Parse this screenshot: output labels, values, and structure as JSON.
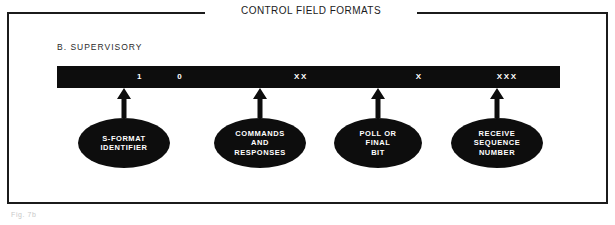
{
  "figure": {
    "title": "CONTROL FIELD FORMATS",
    "section_label": "B. SUPERVISORY",
    "bottom_caption": "Fig. 7b"
  },
  "colors": {
    "bar_fill": "#0d0d0d",
    "bar_text": "#ffffff",
    "frame_border": "#1b1b1b",
    "page_background": "#ffffff",
    "ellipse_fill": "#0d0d0d"
  },
  "field_bar": {
    "bits": [
      {
        "label": "1",
        "center_pct": 16.5
      },
      {
        "label": "0",
        "center_pct": 24.5
      },
      {
        "label": "XX",
        "center_pct": 48.5
      },
      {
        "label": "X",
        "center_pct": 72.0
      },
      {
        "label": "XXX",
        "center_pct": 89.5
      }
    ]
  },
  "callouts": [
    {
      "name": "s-format-identifier",
      "text": "S-FORMAT\nIDENTIFIER",
      "center_x": 124,
      "ellipse_width": 92,
      "ellipse_height": 50,
      "arrow_icon": "arrow-up-icon"
    },
    {
      "name": "commands-and-responses",
      "text": "COMMANDS\nAND\nRESPONSES",
      "center_x": 260,
      "ellipse_width": 92,
      "ellipse_height": 50,
      "arrow_icon": "arrow-up-icon"
    },
    {
      "name": "poll-or-final-bit",
      "text": "POLL OR\nFINAL\nBIT",
      "center_x": 378,
      "ellipse_width": 88,
      "ellipse_height": 50,
      "arrow_icon": "arrow-up-icon"
    },
    {
      "name": "receive-sequence-number",
      "text": "RECEIVE\nSEQUENCE\nNUMBER",
      "center_x": 497,
      "ellipse_width": 92,
      "ellipse_height": 50,
      "arrow_icon": "arrow-up-icon"
    }
  ]
}
